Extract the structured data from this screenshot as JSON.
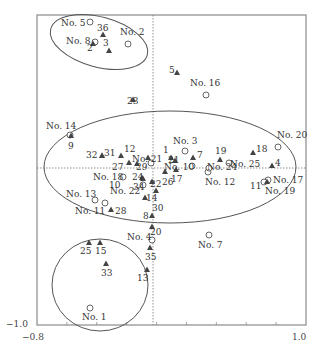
{
  "chart_data": {
    "type": "scatter",
    "title": "",
    "xlabel": "",
    "ylabel": "",
    "xlim": [
      -0.8,
      1.0
    ],
    "ylim": [
      -1.0,
      1.0
    ],
    "grid": false,
    "axis_ticks": {
      "x_left": "−0.8",
      "x_right": "1.0",
      "y_bottom": "−1.0"
    },
    "frame": {
      "x0": 37,
      "y0": 15,
      "x1": 306,
      "y1": 325
    },
    "origin": {
      "x": 153,
      "y": 168
    },
    "series": [
      {
        "name": "Sample sites",
        "marker": "circle-open",
        "points": [
          {
            "label": "No. 1",
            "px": 90,
            "py": 308,
            "lx": 82,
            "ly": 320
          },
          {
            "label": "No. 2",
            "px": 128,
            "py": 44,
            "lx": 120,
            "ly": 35
          },
          {
            "label": "No. 3",
            "px": 185,
            "py": 151,
            "lx": 173,
            "ly": 144
          },
          {
            "label": "No. 4",
            "px": 152,
            "py": 240,
            "lx": 127,
            "ly": 240
          },
          {
            "label": "No. 5",
            "px": 90,
            "py": 22,
            "lx": 61,
            "ly": 26
          },
          {
            "label": "No. 7",
            "px": 209,
            "py": 235,
            "lx": 198,
            "ly": 248
          },
          {
            "label": "No. 8",
            "px": 95,
            "py": 42,
            "lx": 66,
            "ly": 44
          },
          {
            "label": "No. 10",
            "px": 192,
            "py": 166,
            "lx": 164,
            "ly": 170
          },
          {
            "label": "No. 11",
            "px": 105,
            "py": 203,
            "lx": 75,
            "ly": 214
          },
          {
            "label": "No. 12",
            "px": 208,
            "py": 172,
            "lx": 205,
            "ly": 185
          },
          {
            "label": "No. 13",
            "px": 95,
            "py": 200,
            "lx": 66,
            "ly": 197
          },
          {
            "label": "No. 14",
            "px": 70,
            "py": 135,
            "lx": 46,
            "ly": 129
          },
          {
            "label": "No. 16",
            "px": 206,
            "py": 95,
            "lx": 190,
            "ly": 86
          },
          {
            "label": "No. 17",
            "px": 268,
            "py": 180,
            "lx": 273,
            "ly": 183
          },
          {
            "label": "No. 18",
            "px": 123,
            "py": 177,
            "lx": 93,
            "ly": 180
          },
          {
            "label": "No. 19",
            "px": 264,
            "py": 182,
            "lx": 265,
            "ly": 194
          },
          {
            "label": "No. 20",
            "px": 278,
            "py": 147,
            "lx": 277,
            "ly": 138
          },
          {
            "label": "No. 21",
            "px": 151,
            "py": 163,
            "lx": 132,
            "ly": 162
          },
          {
            "label": "No. 22",
            "px": 143,
            "py": 185,
            "lx": 110,
            "ly": 194
          },
          {
            "label": "No. 24",
            "px": 209,
            "py": 168,
            "lx": 207,
            "ly": 170
          },
          {
            "label": "No. 25",
            "px": 229,
            "py": 163,
            "lx": 230,
            "ly": 167
          }
        ]
      },
      {
        "name": "Species",
        "marker": "triangle-filled",
        "points": [
          {
            "label": "1",
            "px": 171,
            "py": 158,
            "lx": 163,
            "ly": 153
          },
          {
            "label": "2",
            "px": 93,
            "py": 44,
            "lx": 87,
            "ly": 51
          },
          {
            "label": "3",
            "px": 109,
            "py": 51,
            "lx": 103,
            "ly": 46
          },
          {
            "label": "4",
            "px": 272,
            "py": 166,
            "lx": 275,
            "ly": 166
          },
          {
            "label": "5",
            "px": 177,
            "py": 73,
            "lx": 169,
            "ly": 73
          },
          {
            "label": "7",
            "px": 193,
            "py": 158,
            "lx": 197,
            "ly": 158
          },
          {
            "label": "8",
            "px": 152,
            "py": 216,
            "lx": 143,
            "ly": 219
          },
          {
            "label": "9",
            "px": 71,
            "py": 136,
            "lx": 68,
            "ly": 149
          },
          {
            "label": "10",
            "px": 148,
            "py": 158,
            "lx": 109,
            "ly": 188
          },
          {
            "label": "11",
            "px": 267,
            "py": 182,
            "lx": 250,
            "ly": 189
          },
          {
            "label": "12",
            "px": 121,
            "py": 156,
            "lx": 124,
            "ly": 152
          },
          {
            "label": "13",
            "px": 147,
            "py": 270,
            "lx": 137,
            "ly": 281
          },
          {
            "label": "14",
            "px": 145,
            "py": 198,
            "lx": 146,
            "ly": 201
          },
          {
            "label": "15",
            "px": 100,
            "py": 243,
            "lx": 95,
            "ly": 254
          },
          {
            "label": "17",
            "px": 176,
            "py": 170,
            "lx": 171,
            "ly": 182
          },
          {
            "label": "18",
            "px": 253,
            "py": 153,
            "lx": 256,
            "ly": 152
          },
          {
            "label": "19",
            "px": 220,
            "py": 160,
            "lx": 215,
            "ly": 154
          },
          {
            "label": "20",
            "px": 152,
            "py": 227,
            "lx": 150,
            "ly": 235
          },
          {
            "label": "21",
            "px": 175,
            "py": 161,
            "lx": 168,
            "ly": 163
          },
          {
            "label": "22",
            "px": 152,
            "py": 182,
            "lx": 150,
            "ly": 187
          },
          {
            "label": "23",
            "px": 133,
            "py": 100,
            "lx": 127,
            "ly": 104
          },
          {
            "label": "24",
            "px": 143,
            "py": 179,
            "lx": 132,
            "ly": 180
          },
          {
            "label": "25",
            "px": 89,
            "py": 243,
            "lx": 80,
            "ly": 254
          },
          {
            "label": "26",
            "px": 165,
            "py": 172,
            "lx": 162,
            "ly": 185
          },
          {
            "label": "27",
            "px": 129,
            "py": 163,
            "lx": 112,
            "ly": 170
          },
          {
            "label": "28",
            "px": 111,
            "py": 210,
            "lx": 115,
            "ly": 214
          },
          {
            "label": "29",
            "px": 137,
            "py": 164,
            "lx": 136,
            "ly": 170
          },
          {
            "label": "30",
            "px": 156,
            "py": 191,
            "lx": 152,
            "ly": 211
          },
          {
            "label": "31",
            "px": 102,
            "py": 156,
            "lx": 104,
            "ly": 156
          },
          {
            "label": "32",
            "px": 102,
            "py": 156,
            "lx": 86,
            "ly": 158
          },
          {
            "label": "33",
            "px": 106,
            "py": 264,
            "lx": 101,
            "ly": 276
          },
          {
            "label": "34",
            "px": 142,
            "py": 178,
            "lx": 133,
            "ly": 190
          },
          {
            "label": "35",
            "px": 150,
            "py": 248,
            "lx": 145,
            "ly": 260
          },
          {
            "label": "36",
            "px": 103,
            "py": 35,
            "lx": 97,
            "ly": 31
          }
        ]
      }
    ],
    "ellipses": [
      {
        "name": "group-top-left",
        "cx": 99,
        "cy": 42,
        "rx": 50,
        "ry": 25,
        "rotate": 15
      },
      {
        "name": "group-center",
        "cx": 170,
        "cy": 167,
        "rx": 126,
        "ry": 56,
        "rotate": 0
      },
      {
        "name": "group-bottom-left",
        "cx": 100,
        "cy": 285,
        "rx": 48,
        "ry": 46,
        "rotate": 0
      }
    ]
  }
}
